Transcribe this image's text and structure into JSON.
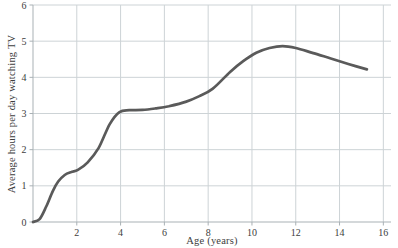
{
  "chart_data": {
    "type": "line",
    "title": "",
    "xlabel": "Age (years)",
    "ylabel": "Average hours per day watching TV",
    "xlim": [
      0,
      16.35
    ],
    "ylim": [
      0,
      6
    ],
    "x_ticks": [
      2,
      4,
      6,
      8,
      10,
      12,
      14,
      16
    ],
    "y_ticks": [
      0,
      1,
      2,
      3,
      4,
      5,
      6
    ],
    "grid": true,
    "legend": false,
    "series": [
      {
        "name": "average-tv-hours-by-age",
        "points": [
          [
            0,
            0
          ],
          [
            0.3,
            0.08
          ],
          [
            0.6,
            0.42
          ],
          [
            0.9,
            0.85
          ],
          [
            1.15,
            1.12
          ],
          [
            1.45,
            1.3
          ],
          [
            1.75,
            1.38
          ],
          [
            2.05,
            1.44
          ],
          [
            2.5,
            1.65
          ],
          [
            3.0,
            2.05
          ],
          [
            3.5,
            2.7
          ],
          [
            3.95,
            3.04
          ],
          [
            4.4,
            3.09
          ],
          [
            5.0,
            3.1
          ],
          [
            5.6,
            3.14
          ],
          [
            6.2,
            3.2
          ],
          [
            7.0,
            3.33
          ],
          [
            7.6,
            3.48
          ],
          [
            8.2,
            3.68
          ],
          [
            9.0,
            4.15
          ],
          [
            9.6,
            4.45
          ],
          [
            10.2,
            4.68
          ],
          [
            10.8,
            4.81
          ],
          [
            11.4,
            4.86
          ],
          [
            12.0,
            4.81
          ],
          [
            12.8,
            4.67
          ],
          [
            13.6,
            4.52
          ],
          [
            14.4,
            4.37
          ],
          [
            15.25,
            4.22
          ]
        ]
      }
    ],
    "colors": {
      "curve": "#5a5a5a",
      "grid": "#cdd3d6",
      "axis": "#a9b1b5",
      "text": "#3d3d3d",
      "background": "#ffffff"
    }
  }
}
